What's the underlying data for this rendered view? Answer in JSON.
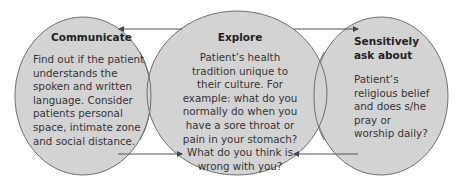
{
  "diagram": {
    "colors": {
      "ellipse_fill": "#d3d3d3",
      "ellipse_stroke": "#6f6f6f",
      "arrow": "#555555",
      "background": "#ffffff"
    },
    "nodes": [
      {
        "id": "communicate",
        "title": "Communicate",
        "body": "Find out if the patient understands the spoken and written language. Consider patients personal space, intimate zone and social distance."
      },
      {
        "id": "explore",
        "title": "Explore",
        "body": "Patient’s health tradition unique to their culture. For example: what do you normally do when you have a sore throat or pain in your stomach? What do you think is wrong with you?"
      },
      {
        "id": "sensitively-ask",
        "title": "Sensitively ask about",
        "body": "Patient’s religious belief and does s/he pray or worship daily?"
      }
    ],
    "edges": [
      {
        "from": "explore",
        "to": "communicate",
        "position": "top-left"
      },
      {
        "from": "explore",
        "to": "sensitively-ask",
        "position": "top-right"
      },
      {
        "from": "communicate",
        "to": "explore",
        "position": "bottom-left"
      },
      {
        "from": "sensitively-ask",
        "to": "explore",
        "position": "bottom-right"
      }
    ]
  }
}
